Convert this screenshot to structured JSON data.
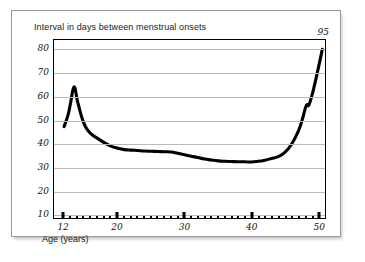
{
  "figure": {
    "title": "Interval in days between menstrual onsets",
    "x_axis_label": "Age (years)",
    "annotation": "95",
    "annotation_x": 50.6,
    "annotation_y": 84.5
  },
  "chart_data": {
    "type": "line",
    "title": "Interval in days between menstrual onsets",
    "xlabel": "Age (years)",
    "ylabel": "",
    "xlim": [
      10.5,
      51.0
    ],
    "ylim": [
      8.0,
      84.0
    ],
    "grid": true,
    "legend": null,
    "line_color": "#000000",
    "line_width": 3.0,
    "y_ticks": [
      10,
      20,
      30,
      40,
      50,
      60,
      70,
      80
    ],
    "y_tick_labels": [
      "10",
      "20",
      "30",
      "40",
      "50",
      "60",
      "70",
      "80"
    ],
    "x_ticks": [
      12,
      20,
      30,
      40,
      50
    ],
    "x_tick_labels": [
      "12",
      "20",
      "30",
      "40",
      "50"
    ],
    "x_minor_ticks": [
      13,
      14,
      15,
      16,
      17,
      18,
      19,
      21,
      22,
      23,
      24,
      25,
      26,
      27,
      28,
      29,
      31,
      32,
      33,
      34,
      35,
      36,
      37,
      38,
      39,
      41,
      42,
      43,
      44,
      45,
      46,
      47,
      48,
      49
    ],
    "annotations": [
      {
        "text": "95",
        "x": 50.6,
        "y": 84.5,
        "note": "true value at age 50.6 exceeds axis maximum"
      }
    ],
    "series": [
      {
        "name": "Interval in days between menstrual onsets",
        "x": [
          12.0,
          12.6,
          13.0,
          13.5,
          14.0,
          14.6,
          15.2,
          16.0,
          17.0,
          18.0,
          19.0,
          20.0,
          21.0,
          22.0,
          23.0,
          24.0,
          25.0,
          26.0,
          27.0,
          28.0,
          29.0,
          30.0,
          31.0,
          32.0,
          33.0,
          34.0,
          35.0,
          36.0,
          37.0,
          38.0,
          39.0,
          40.0,
          41.0,
          42.0,
          43.0,
          44.0,
          45.0,
          46.0,
          47.0,
          47.6,
          48.2,
          48.6,
          49.2,
          50.0,
          50.6
        ],
        "y": [
          47.0,
          52.0,
          57.5,
          64.0,
          58.0,
          51.5,
          47.0,
          44.0,
          42.0,
          40.2,
          38.7,
          37.8,
          37.2,
          37.0,
          36.8,
          36.6,
          36.5,
          36.4,
          36.3,
          36.2,
          35.6,
          35.0,
          34.4,
          33.8,
          33.2,
          32.8,
          32.4,
          32.2,
          32.1,
          32.0,
          32.0,
          31.9,
          32.2,
          32.7,
          33.4,
          34.2,
          36.0,
          39.5,
          45.0,
          50.0,
          56.0,
          56.3,
          62.0,
          72.0,
          80.0
        ]
      }
    ]
  }
}
